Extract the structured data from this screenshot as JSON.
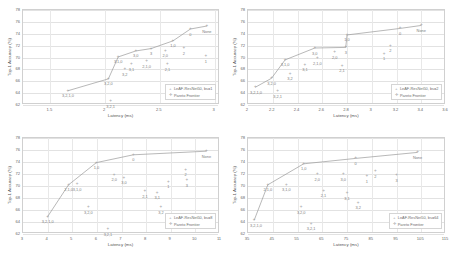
{
  "figure": {
    "panel_count": 4,
    "y_axis_label": "Top-1 Accuracy (%)",
    "x_axis_label": "Latency (ms)",
    "series_marker_label": "LeAF-ResNet50",
    "pareto_label": "Pareto Frontier",
    "colors": {
      "marker": "#a6a6a6",
      "line": "#9a9a9a",
      "grid": "#e2e2e2",
      "text": "#6e6e6e"
    }
  },
  "chart_data": [
    {
      "type": "scatter",
      "panel": "top-left",
      "title": "",
      "xlabel": "Latency (ms)",
      "ylabel": "Top-1 Accuracy (%)",
      "legend": [
        "LeAF-ResNet50, bs=1",
        "Pareto Frontier"
      ],
      "legend_position": "lower-right",
      "grid": true,
      "xlim": [
        1.25,
        3.05
      ],
      "ylim": [
        62,
        78
      ],
      "xticks": [
        "1.5",
        "2",
        "2.5",
        "3"
      ],
      "xtick_values": [
        1.5,
        2.0,
        2.5,
        3.0
      ],
      "yticks": [
        "62",
        "64",
        "66",
        "68",
        "70",
        "72",
        "74",
        "76",
        "78"
      ],
      "ytick_values": [
        62,
        64,
        66,
        68,
        70,
        72,
        74,
        76,
        78
      ],
      "points": [
        {
          "label": "3,2,1,0",
          "x": 1.66,
          "y": 64.4,
          "pareto": true
        },
        {
          "label": "3,2,0",
          "x": 2.03,
          "y": 66.4,
          "pareto": true
        },
        {
          "label": "3,2,1",
          "x": 2.05,
          "y": 62.6,
          "pareto": false
        },
        {
          "label": "3,1,0",
          "x": 2.12,
          "y": 70.1,
          "pareto": true
        },
        {
          "label": "3,2",
          "x": 2.18,
          "y": 68.0,
          "pareto": false
        },
        {
          "label": "3,1",
          "x": 2.24,
          "y": 68.9,
          "pareto": false
        },
        {
          "label": "3,0",
          "x": 2.28,
          "y": 71.1,
          "pareto": true
        },
        {
          "label": "2,1,0",
          "x": 2.38,
          "y": 69.4,
          "pareto": false
        },
        {
          "label": "3",
          "x": 2.42,
          "y": 71.5,
          "pareto": true
        },
        {
          "label": "2,0",
          "x": 2.55,
          "y": 71.1,
          "pareto": false
        },
        {
          "label": "2,1",
          "x": 2.57,
          "y": 68.9,
          "pareto": false
        },
        {
          "label": "1,0",
          "x": 2.62,
          "y": 72.8,
          "pareto": true
        },
        {
          "label": "2",
          "x": 2.72,
          "y": 71.6,
          "pareto": false
        },
        {
          "label": "0",
          "x": 2.78,
          "y": 74.8,
          "pareto": true
        },
        {
          "label": "1",
          "x": 2.92,
          "y": 70.2,
          "pareto": false
        },
        {
          "label": "None",
          "x": 2.93,
          "y": 75.3,
          "pareto": true
        }
      ]
    },
    {
      "type": "scatter",
      "panel": "top-right",
      "title": "",
      "xlabel": "Latency (ms)",
      "ylabel": "Top-1 Accuracy (%)",
      "legend": [
        "LeAF-ResNet50, bs=2",
        "Pareto Frontier"
      ],
      "legend_position": "lower-right",
      "grid": true,
      "xlim": [
        2.0,
        3.6
      ],
      "ylim": [
        62,
        78
      ],
      "xticks": [
        "2",
        "2.2",
        "2.4",
        "2.6",
        "2.8",
        "3",
        "3.2",
        "3.4",
        "3.6"
      ],
      "xtick_values": [
        2.0,
        2.2,
        2.4,
        2.6,
        2.8,
        3.0,
        3.2,
        3.4,
        3.6
      ],
      "yticks": [
        "62",
        "64",
        "66",
        "68",
        "70",
        "72",
        "74",
        "76",
        "78"
      ],
      "ytick_values": [
        62,
        64,
        66,
        68,
        70,
        72,
        74,
        76,
        78
      ],
      "points": [
        {
          "label": "3,2,1,0",
          "x": 2.06,
          "y": 65.0,
          "pareto": true
        },
        {
          "label": "3,2,0",
          "x": 2.19,
          "y": 66.5,
          "pareto": true
        },
        {
          "label": "3,2,1",
          "x": 2.24,
          "y": 64.3,
          "pareto": false
        },
        {
          "label": "3,1,0",
          "x": 2.3,
          "y": 69.6,
          "pareto": true
        },
        {
          "label": "3,2",
          "x": 2.34,
          "y": 67.3,
          "pareto": false
        },
        {
          "label": "3,1",
          "x": 2.46,
          "y": 68.8,
          "pareto": false
        },
        {
          "label": "3,0",
          "x": 2.54,
          "y": 71.6,
          "pareto": true
        },
        {
          "label": "2,1,0",
          "x": 2.56,
          "y": 69.9,
          "pareto": false
        },
        {
          "label": "2,0",
          "x": 2.7,
          "y": 70.9,
          "pareto": false
        },
        {
          "label": "2,1",
          "x": 2.76,
          "y": 68.6,
          "pareto": false
        },
        {
          "label": "3",
          "x": 2.79,
          "y": 71.7,
          "pareto": true
        },
        {
          "label": "1,0",
          "x": 2.8,
          "y": 73.8,
          "pareto": true
        },
        {
          "label": "1",
          "x": 3.1,
          "y": 70.6,
          "pareto": false
        },
        {
          "label": "2",
          "x": 3.15,
          "y": 72.0,
          "pareto": false
        },
        {
          "label": "0",
          "x": 3.23,
          "y": 74.9,
          "pareto": true
        },
        {
          "label": "None",
          "x": 3.4,
          "y": 75.4,
          "pareto": true
        }
      ]
    },
    {
      "type": "scatter",
      "panel": "bottom-left",
      "title": "",
      "xlabel": "Latency (ms)",
      "ylabel": "Top-1 Accuracy (%)",
      "legend": [
        "LeAF-ResNet50, bs=8",
        "Pareto Frontier"
      ],
      "legend_position": "lower-right",
      "grid": true,
      "xlim": [
        3,
        11
      ],
      "ylim": [
        62,
        78
      ],
      "xticks": [
        "3",
        "4",
        "5",
        "6",
        "7",
        "8",
        "9",
        "10",
        "11"
      ],
      "xtick_values": [
        3,
        4,
        5,
        6,
        7,
        8,
        9,
        10,
        11
      ],
      "yticks": [
        "62",
        "64",
        "66",
        "68",
        "70",
        "72",
        "74",
        "76",
        "78"
      ],
      "ytick_values": [
        62,
        64,
        66,
        68,
        70,
        72,
        74,
        76,
        78
      ],
      "points": [
        {
          "label": "3,2,1,0",
          "x": 4.0,
          "y": 64.9,
          "pareto": true
        },
        {
          "label": "2,1,0",
          "x": 4.85,
          "y": 70.2,
          "pareto": true
        },
        {
          "label": "3,1,0",
          "x": 5.2,
          "y": 70.3,
          "pareto": false
        },
        {
          "label": "3,2,0",
          "x": 5.65,
          "y": 66.5,
          "pareto": false
        },
        {
          "label": "1,0",
          "x": 5.98,
          "y": 73.9,
          "pareto": true
        },
        {
          "label": "3,2,1",
          "x": 6.45,
          "y": 62.8,
          "pareto": false
        },
        {
          "label": "2,0",
          "x": 6.7,
          "y": 71.9,
          "pareto": false
        },
        {
          "label": "3,0",
          "x": 7.1,
          "y": 71.4,
          "pareto": false
        },
        {
          "label": "0",
          "x": 7.48,
          "y": 75.2,
          "pareto": true
        },
        {
          "label": "2,1",
          "x": 7.95,
          "y": 69.1,
          "pareto": false
        },
        {
          "label": "3,1",
          "x": 8.45,
          "y": 68.9,
          "pareto": false
        },
        {
          "label": "3,2",
          "x": 8.6,
          "y": 66.5,
          "pareto": false
        },
        {
          "label": "1",
          "x": 8.9,
          "y": 70.7,
          "pareto": false
        },
        {
          "label": "2",
          "x": 9.6,
          "y": 72.7,
          "pareto": false
        },
        {
          "label": "3",
          "x": 9.65,
          "y": 71.0,
          "pareto": false
        },
        {
          "label": "None",
          "x": 10.45,
          "y": 75.8,
          "pareto": true
        }
      ]
    },
    {
      "type": "scatter",
      "panel": "bottom-right",
      "title": "",
      "xlabel": "Latency (ms)",
      "ylabel": "Top-1 Accuracy (%)",
      "legend": [
        "LeAF-ResNet50, bs=64",
        "Pareto Frontier"
      ],
      "legend_position": "lower-right",
      "grid": true,
      "xlim": [
        35,
        115
      ],
      "ylim": [
        62,
        78
      ],
      "xticks": [
        "35",
        "45",
        "55",
        "65",
        "75",
        "85",
        "95",
        "105",
        "115"
      ],
      "xtick_values": [
        35,
        45,
        55,
        65,
        75,
        85,
        95,
        105,
        115
      ],
      "yticks": [
        "62",
        "64",
        "66",
        "68",
        "70",
        "72",
        "74",
        "76",
        "78"
      ],
      "ytick_values": [
        62,
        64,
        66,
        68,
        70,
        72,
        74,
        76,
        78
      ],
      "points": [
        {
          "label": "3,2,1,0",
          "x": 37.5,
          "y": 64.3,
          "pareto": true
        },
        {
          "label": "2,1,0",
          "x": 43.0,
          "y": 70.2,
          "pareto": true
        },
        {
          "label": "3,1,0",
          "x": 50.5,
          "y": 70.2,
          "pareto": false
        },
        {
          "label": "3,2,0",
          "x": 56.5,
          "y": 66.5,
          "pareto": false
        },
        {
          "label": "1,0",
          "x": 57.5,
          "y": 73.7,
          "pareto": true
        },
        {
          "label": "3,2,1",
          "x": 60.5,
          "y": 63.7,
          "pareto": false
        },
        {
          "label": "2,0",
          "x": 63.0,
          "y": 72.0,
          "pareto": false
        },
        {
          "label": "2,1",
          "x": 65.5,
          "y": 69.2,
          "pareto": false
        },
        {
          "label": "3,0",
          "x": 73.5,
          "y": 72.0,
          "pareto": false
        },
        {
          "label": "3,1",
          "x": 75.0,
          "y": 68.8,
          "pareto": false
        },
        {
          "label": "0",
          "x": 78.5,
          "y": 74.6,
          "pareto": true
        },
        {
          "label": "3,2",
          "x": 79.5,
          "y": 67.2,
          "pareto": false
        },
        {
          "label": "1",
          "x": 83.0,
          "y": 71.6,
          "pareto": false
        },
        {
          "label": "2",
          "x": 86.5,
          "y": 72.5,
          "pareto": false
        },
        {
          "label": "3",
          "x": 95.0,
          "y": 71.8,
          "pareto": false
        },
        {
          "label": "None",
          "x": 103.5,
          "y": 75.6,
          "pareto": true
        }
      ]
    }
  ]
}
